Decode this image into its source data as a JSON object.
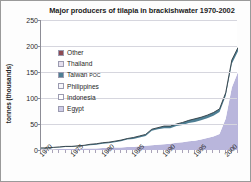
{
  "chart_data": {
    "type": "area",
    "title": "Major producers of tilapia in brackishwater 1970-2002",
    "xlabel": "",
    "ylabel": "tonnes (thousands)",
    "ylim": [
      0,
      250
    ],
    "xlim": [
      1970,
      2002
    ],
    "ytick_labels": [
      "0",
      "50",
      "100",
      "150",
      "200",
      "250"
    ],
    "ytick_values": [
      0,
      50,
      100,
      150,
      200,
      250
    ],
    "xtick_labels": [
      "1970",
      "1975",
      "1980",
      "1985",
      "1990",
      "1995",
      "2000"
    ],
    "xtick_values": [
      1970,
      1975,
      1980,
      1985,
      1990,
      1995,
      2000
    ],
    "grid": true,
    "legend_position": "inside-upper-left",
    "stacked": true,
    "x": [
      1970,
      1971,
      1972,
      1973,
      1974,
      1975,
      1976,
      1977,
      1978,
      1979,
      1980,
      1981,
      1982,
      1983,
      1984,
      1985,
      1986,
      1987,
      1988,
      1989,
      1990,
      1991,
      1992,
      1993,
      1994,
      1995,
      1996,
      1997,
      1998,
      1999,
      2000,
      2001,
      2002
    ],
    "series": [
      {
        "name": "Egypt",
        "color": "#b9b6dc",
        "values": [
          1,
          1,
          1,
          2,
          2,
          2,
          2,
          3,
          3,
          3,
          4,
          4,
          5,
          5,
          6,
          6,
          7,
          8,
          9,
          10,
          11,
          12,
          14,
          15,
          17,
          18,
          20,
          23,
          26,
          31,
          60,
          120,
          150
        ]
      },
      {
        "name": "Indonesia",
        "color": "#ffffff",
        "values": [
          2,
          2,
          3,
          3,
          4,
          4,
          5,
          5,
          6,
          7,
          8,
          9,
          10,
          12,
          14,
          15,
          17,
          19,
          28,
          30,
          31,
          30,
          32,
          33,
          35,
          36,
          37,
          38,
          40,
          42,
          44,
          46,
          40
        ]
      },
      {
        "name": "Philippines",
        "color": "#f2f2f8",
        "values": [
          0,
          0,
          0,
          0,
          0,
          0,
          0,
          0,
          0,
          0,
          0,
          0,
          0,
          0,
          0,
          0,
          0,
          0,
          0,
          0,
          0,
          0,
          0,
          0,
          0,
          0,
          0,
          0,
          0,
          0,
          0,
          0,
          0
        ]
      },
      {
        "name": "Taiwan POC",
        "color": "#4e7f94",
        "values": [
          1,
          1,
          1,
          1,
          1,
          1,
          1,
          1,
          2,
          2,
          2,
          2,
          2,
          2,
          2,
          3,
          3,
          3,
          3,
          3,
          4,
          4,
          4,
          5,
          5,
          6,
          6,
          6,
          6,
          6,
          6,
          7,
          7
        ]
      },
      {
        "name": "Thailand",
        "color": "#e6e0ee",
        "values": [
          0,
          0,
          0,
          0,
          0,
          0,
          0,
          0,
          0,
          0,
          0,
          0,
          0,
          0,
          0,
          0,
          0,
          0,
          0,
          0,
          0,
          0,
          0,
          0,
          0,
          0,
          0,
          0,
          0,
          0,
          0,
          0,
          0
        ]
      },
      {
        "name": "Other",
        "color": "#8e4a52",
        "values": [
          0,
          0,
          0,
          0,
          0,
          0,
          0,
          0,
          0,
          0,
          0,
          0,
          0,
          0,
          0,
          0,
          0,
          0,
          0,
          0,
          0,
          0,
          0,
          0,
          0,
          0,
          0,
          0,
          0,
          0,
          0,
          0,
          0
        ]
      }
    ],
    "legend": [
      {
        "label": "Other",
        "label_small": "",
        "color": "#8e4a52"
      },
      {
        "label": "Thailand",
        "label_small": "",
        "color": "#e6e0ee"
      },
      {
        "label": "Taiwan ",
        "label_small": "POC",
        "color": "#4e7f94"
      },
      {
        "label": "Philippines",
        "label_small": "",
        "color": "#f7f7fb"
      },
      {
        "label": "Indonesia",
        "label_small": "",
        "color": "#ffffff"
      },
      {
        "label": "Egypt",
        "label_small": "",
        "color": "#cfcde8"
      }
    ]
  }
}
